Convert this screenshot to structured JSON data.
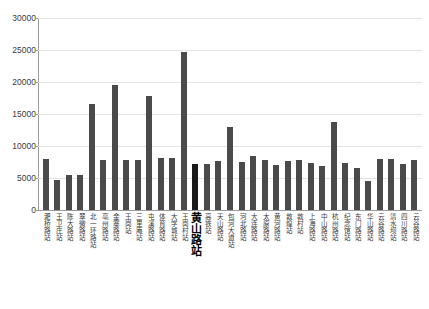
{
  "chart_data": {
    "type": "bar",
    "title": "",
    "subtitle": "",
    "xlabel": "",
    "ylabel": "",
    "ylim": [
      0,
      30000
    ],
    "ytick_values": [
      0,
      5000,
      10000,
      15000,
      20000,
      25000,
      30000
    ],
    "ytick_labels": [
      "0",
      "5000",
      "10000",
      "15000",
      "20000",
      "25000",
      "30000"
    ],
    "grid": true,
    "legend": false,
    "legend_position": "none",
    "bar_color": "#4a4a4a",
    "highlight_color": "#1a1a1a",
    "highlight_index": 13,
    "highlight_label": "黄山路站",
    "categories": [
      "淝桥路站",
      "王卫庄站",
      "陈大路站",
      "翠微路站",
      "北一环路站",
      "亳州路站",
      "金寨路站",
      "王岗站",
      "三里庵站",
      "屯溪路站",
      "体育路站",
      "大学城站",
      "王岗村站",
      "黄山路站",
      "高铁站",
      "天山路站",
      "包河大道站",
      "河北路站",
      "大连路站",
      "太原路站",
      "黄河路站",
      "敦煌站",
      "敦村站",
      "上海路站",
      "中山路站",
      "杭州路站",
      "纪念馆站",
      "东门路站",
      "华山路站",
      "云谷路站",
      "清水坝站",
      "四川路站",
      "云谷路站"
    ],
    "values": [
      8000,
      4700,
      5500,
      5500,
      16500,
      7800,
      19600,
      7800,
      7800,
      17800,
      8200,
      8200,
      24700,
      7200,
      7200,
      7700,
      13000,
      7500,
      8400,
      7800,
      7000,
      7600,
      7800,
      7300,
      6900,
      13700,
      7300,
      6500,
      4600,
      7900,
      7900,
      7200,
      7800
    ]
  }
}
